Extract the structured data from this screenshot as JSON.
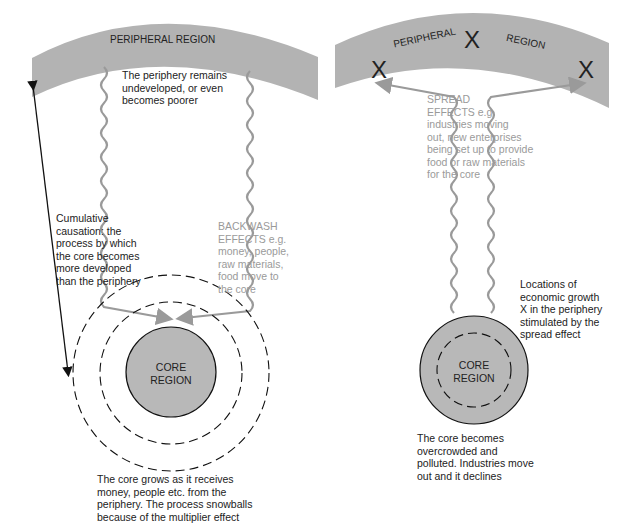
{
  "left_diagram": {
    "band_label": "PERIPHERAL REGION",
    "periphery_note": [
      "The periphery remains",
      "undeveloped, or even",
      "becomes poorer"
    ],
    "cumulative_causation": [
      "Cumulative",
      "causation: the",
      "process by which",
      "the core becomes",
      "more developed",
      "than the periphery"
    ],
    "backwash_effects": [
      "BACKWASH",
      "EFFECTS e.g.",
      "money, people,",
      "raw materials,",
      "food move to",
      "the core"
    ],
    "core_label": [
      "CORE",
      "REGION"
    ],
    "core_caption": [
      "The core grows as it receives",
      "money, people etc. from the",
      "periphery. The process snowballs",
      "because of the multiplier effect"
    ]
  },
  "right_diagram": {
    "band_label_1": "PERIPHERAL",
    "band_label_2": "REGION",
    "growth_marker": "X",
    "spread_effects": [
      "SPREAD",
      "EFFECTS e.g.",
      "industries moving",
      "out, new enterprises",
      "being set up to provide",
      "food or raw materials",
      "for the core"
    ],
    "growth_locations": [
      "Locations of",
      "economic growth",
      "X in the periphery",
      "stimulated by the",
      "spread effect"
    ],
    "core_label": [
      "CORE",
      "REGION"
    ],
    "core_caption": [
      "The core becomes",
      "overcrowded and",
      "polluted. Industries move",
      "out and it declines"
    ]
  },
  "colors": {
    "band": "#b3b3b3",
    "core_fill": "#b8b8b8",
    "arrow_grey": "#9a9a9a",
    "text": "#222222",
    "text_grey": "#9a9a9a"
  }
}
